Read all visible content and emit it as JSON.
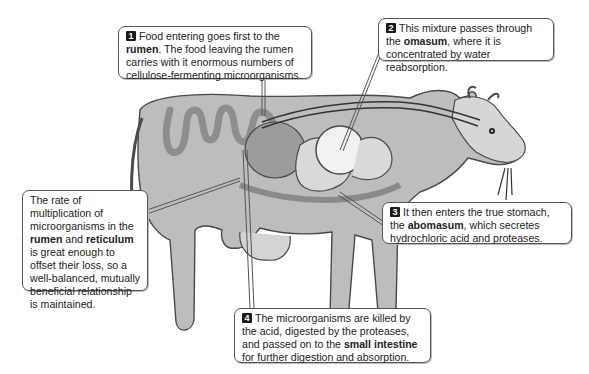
{
  "diagram": {
    "callouts": [
      {
        "id": "1",
        "badge": "1",
        "parts": [
          {
            "text": "Food entering goes first to the ",
            "bold": false
          },
          {
            "text": "rumen",
            "bold": true
          },
          {
            "text": ". The food leaving the rumen carries with it enormous numbers of cellulose-fermenting microorganisms.",
            "bold": false
          }
        ]
      },
      {
        "id": "2",
        "badge": "2",
        "parts": [
          {
            "text": "This mixture passes through the ",
            "bold": false
          },
          {
            "text": "omasum",
            "bold": true
          },
          {
            "text": ", where it is concentrated by water reabsorption.",
            "bold": false
          }
        ]
      },
      {
        "id": "3",
        "badge": "3",
        "parts": [
          {
            "text": "It then enters the true stomach, the ",
            "bold": false
          },
          {
            "text": "abomasum",
            "bold": true
          },
          {
            "text": ", which secretes hydrochloric acid and proteases.",
            "bold": false
          }
        ]
      },
      {
        "id": "4",
        "badge": "4",
        "parts": [
          {
            "text": "The microorganisms are killed by the acid, digested by the proteases, and passed on to the ",
            "bold": false
          },
          {
            "text": "small intestine",
            "bold": true
          },
          {
            "text": " for further digestion and absorption.",
            "bold": false
          }
        ]
      },
      {
        "id": "side",
        "badge": "",
        "parts": [
          {
            "text": "The rate of multiplication of microorganisms in the ",
            "bold": false
          },
          {
            "text": "rumen",
            "bold": true
          },
          {
            "text": " and ",
            "bold": false
          },
          {
            "text": "reticulum",
            "bold": true
          },
          {
            "text": " is great enough to offset their loss, so a well-balanced, mutually beneficial relationship is maintained.",
            "bold": false
          }
        ]
      }
    ],
    "colors": {
      "cow_body": "#b8b8b8",
      "cow_outline": "#4a4a4a",
      "organ_fill": "#e2e2e2",
      "intestine": "#9a9a9a",
      "callout_border": "#555555",
      "badge_bg": "#1a1a1a"
    }
  }
}
